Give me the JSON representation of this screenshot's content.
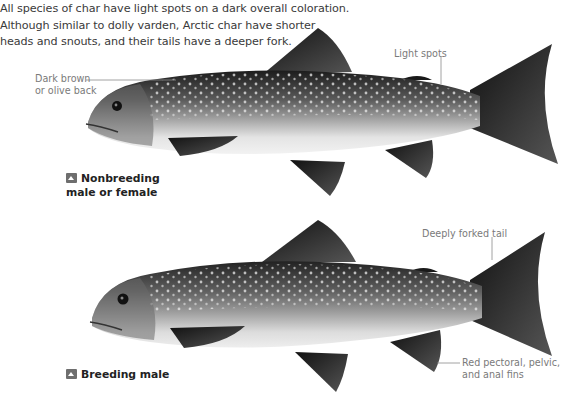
{
  "intro": {
    "lines": [
      "All species of char have light spots on a dark overall coloration.",
      "Although similar to dolly varden, Arctic char have shorter",
      "heads and snouts, and their tails have a deeper fork."
    ]
  },
  "figures": [
    {
      "caption_line1": "Nonbreeding",
      "caption_line2": "male or female",
      "callouts": [
        {
          "line1": "Dark brown",
          "line2": "or olive back"
        },
        {
          "line1": "Light spots"
        }
      ]
    },
    {
      "caption_line1": "Breeding male",
      "callouts": [
        {
          "line1": "Deeply forked tail"
        },
        {
          "line1": "Red pectoral, pelvic,",
          "line2": "and anal fins"
        }
      ]
    }
  ],
  "icons": {
    "caption_badge": "triangle-up-badge-icon"
  },
  "colors": {
    "text": "#3a3a3a",
    "callout_text": "#7a7a7a",
    "leader_line": "#8a8a8a",
    "fish_dark": "#1e1e1e",
    "fish_belly": "#e6e6e6"
  }
}
